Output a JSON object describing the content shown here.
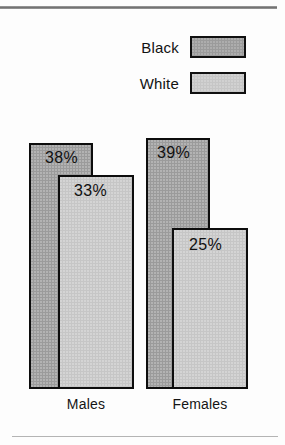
{
  "colors": {
    "black_series": "#9b9b9b",
    "white_series": "#c6c6c6",
    "outline": "#0d0d0d",
    "text": "#101010",
    "rule": "#8e8e8e",
    "background": "#fdfdfd"
  },
  "legend": {
    "items": [
      {
        "label": "Black",
        "swatch_color": "#9b9b9b"
      },
      {
        "label": "White",
        "swatch_color": "#c6c6c6"
      }
    ]
  },
  "chart_data": {
    "type": "bar",
    "title": "",
    "subtitle": "",
    "xlabel": "",
    "ylabel": "",
    "grid": false,
    "legend_position": "top-right",
    "value_suffix": "%",
    "ylim": [
      0,
      45
    ],
    "categories": [
      "Males",
      "Females"
    ],
    "series": [
      {
        "name": "Black",
        "color": "#9b9b9b",
        "values": [
          38,
          39
        ],
        "labels": [
          "38%",
          "39%"
        ]
      },
      {
        "name": "White",
        "color": "#c6c6c6",
        "values": [
          33,
          25
        ],
        "labels": [
          "33%",
          "25%"
        ]
      }
    ]
  },
  "bars": [
    {
      "name": "males-black",
      "group": "Males",
      "series": "Black",
      "label": "38%",
      "color": "#9b9b9b",
      "left": 29,
      "top": 143,
      "width": 64,
      "height": 246,
      "label_left": 45,
      "label_top": 149
    },
    {
      "name": "males-white",
      "group": "Males",
      "series": "White",
      "label": "33%",
      "color": "#c6c6c6",
      "left": 58,
      "top": 175,
      "width": 76,
      "height": 214,
      "label_left": 74,
      "label_top": 182
    },
    {
      "name": "females-black",
      "group": "Females",
      "series": "Black",
      "label": "39%",
      "color": "#9b9b9b",
      "left": 146,
      "top": 138,
      "width": 64,
      "height": 251,
      "label_left": 157,
      "label_top": 144
    },
    {
      "name": "females-white",
      "group": "Females",
      "series": "White",
      "label": "25%",
      "color": "#c6c6c6",
      "left": 172,
      "top": 228,
      "width": 76,
      "height": 161,
      "label_left": 189,
      "label_top": 236
    }
  ],
  "group_labels": [
    {
      "text": "Males",
      "left": 36,
      "top": 396,
      "width": 100
    },
    {
      "text": "Females",
      "left": 148,
      "top": 396,
      "width": 104
    }
  ]
}
